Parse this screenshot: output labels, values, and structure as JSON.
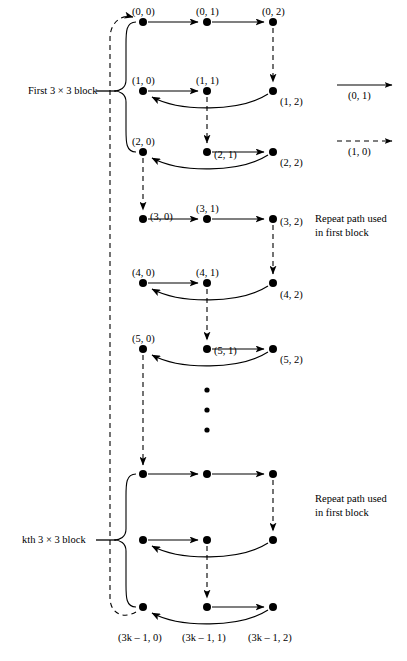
{
  "figure": {
    "kind": "lattice-path-diagram",
    "width": 407,
    "height": 661,
    "background": "#ffffff",
    "ink": "#000000"
  },
  "left_labels": {
    "first_block": "First 3 × 3 block",
    "kth_block_prefix": "k",
    "kth_block_rest": "th 3 × 3 block"
  },
  "legend": {
    "solid": {
      "style": "solid-arrow",
      "label": "(0, 1)"
    },
    "dashed": {
      "style": "dashed-arrow",
      "label": "(1, 0)"
    }
  },
  "annotations": [
    {
      "line1": "Repeat path used",
      "line2": "in first block"
    },
    {
      "line1": "Repeat path used",
      "line2": "in first block"
    }
  ],
  "nodes": [
    {
      "id": "n00",
      "label": "(0, 0)",
      "x": 143,
      "y": 22,
      "lx": 132,
      "ly": 5,
      "label_anchor": "start"
    },
    {
      "id": "n01",
      "label": "(0, 1)",
      "x": 207,
      "y": 22,
      "lx": 196,
      "ly": 5,
      "label_anchor": "start"
    },
    {
      "id": "n02",
      "label": "(0, 2)",
      "x": 273,
      "y": 22,
      "lx": 262,
      "ly": 5,
      "label_anchor": "start"
    },
    {
      "id": "n10",
      "label": "(1, 0)",
      "x": 143,
      "y": 91,
      "lx": 132,
      "ly": 74,
      "label_anchor": "start"
    },
    {
      "id": "n11",
      "label": "(1, 1)",
      "x": 207,
      "y": 91,
      "lx": 196,
      "ly": 74,
      "label_anchor": "start"
    },
    {
      "id": "n12",
      "label": "(1, 2)",
      "x": 273,
      "y": 91,
      "lx": 280,
      "ly": 95,
      "label_anchor": "start"
    },
    {
      "id": "n20",
      "label": "(2, 0)",
      "x": 143,
      "y": 152,
      "lx": 132,
      "ly": 135,
      "label_anchor": "start"
    },
    {
      "id": "n21",
      "label": "(2, 1)",
      "x": 207,
      "y": 152,
      "lx": 214,
      "ly": 148,
      "label_anchor": "start"
    },
    {
      "id": "n22",
      "label": "(2, 2)",
      "x": 273,
      "y": 152,
      "lx": 280,
      "ly": 156,
      "label_anchor": "start"
    },
    {
      "id": "n30",
      "label": "(3, 0)",
      "x": 143,
      "y": 219,
      "lx": 150,
      "ly": 210,
      "label_anchor": "start"
    },
    {
      "id": "n31",
      "label": "(3, 1)",
      "x": 207,
      "y": 219,
      "lx": 196,
      "ly": 202,
      "label_anchor": "start"
    },
    {
      "id": "n32",
      "label": "(3, 2)",
      "x": 273,
      "y": 219,
      "lx": 280,
      "ly": 215,
      "label_anchor": "start"
    },
    {
      "id": "n40",
      "label": "(4, 0)",
      "x": 143,
      "y": 283,
      "lx": 132,
      "ly": 266,
      "label_anchor": "start"
    },
    {
      "id": "n41",
      "label": "(4, 1)",
      "x": 207,
      "y": 283,
      "lx": 196,
      "ly": 266,
      "label_anchor": "start"
    },
    {
      "id": "n42",
      "label": "(4, 2)",
      "x": 273,
      "y": 283,
      "lx": 280,
      "ly": 288,
      "label_anchor": "start"
    },
    {
      "id": "n50",
      "label": "(5, 0)",
      "x": 143,
      "y": 349,
      "lx": 132,
      "ly": 332,
      "label_anchor": "start"
    },
    {
      "id": "n51",
      "label": "(5, 1)",
      "x": 207,
      "y": 349,
      "lx": 214,
      "ly": 344,
      "label_anchor": "start"
    },
    {
      "id": "n52",
      "label": "(5, 2)",
      "x": 273,
      "y": 349,
      "lx": 280,
      "ly": 353,
      "label_anchor": "start"
    },
    {
      "id": "nk00",
      "label": "",
      "x": 143,
      "y": 474,
      "lx": 0,
      "ly": 0,
      "label_anchor": "start"
    },
    {
      "id": "nk01",
      "label": "",
      "x": 207,
      "y": 474,
      "lx": 0,
      "ly": 0,
      "label_anchor": "start"
    },
    {
      "id": "nk02",
      "label": "",
      "x": 273,
      "y": 474,
      "lx": 0,
      "ly": 0,
      "label_anchor": "start"
    },
    {
      "id": "nk10",
      "label": "",
      "x": 143,
      "y": 540,
      "lx": 0,
      "ly": 0,
      "label_anchor": "start"
    },
    {
      "id": "nk11",
      "label": "",
      "x": 207,
      "y": 540,
      "lx": 0,
      "ly": 0,
      "label_anchor": "start"
    },
    {
      "id": "nk12",
      "label": "",
      "x": 273,
      "y": 540,
      "lx": 0,
      "ly": 0,
      "label_anchor": "start"
    },
    {
      "id": "nk20",
      "label": "(3k – 1, 0)",
      "x": 143,
      "y": 607,
      "lx": 118,
      "ly": 631,
      "label_anchor": "start"
    },
    {
      "id": "nk21",
      "label": "(3k – 1, 1)",
      "x": 207,
      "y": 607,
      "lx": 182,
      "ly": 631,
      "label_anchor": "start"
    },
    {
      "id": "nk22",
      "label": "(3k – 1, 2)",
      "x": 273,
      "y": 607,
      "lx": 248,
      "ly": 631,
      "label_anchor": "start"
    }
  ],
  "ellipsis_dots": [
    {
      "x": 207,
      "y": 390
    },
    {
      "x": 207,
      "y": 410
    },
    {
      "x": 207,
      "y": 430
    }
  ],
  "chart_data": {
    "type": "diagram",
    "grid_columns": 3,
    "grid_rows_label": "3k",
    "step_vectors": {
      "solid": "(0, 1)",
      "dashed": "(1, 0)"
    },
    "row_labels": [
      "0",
      "1",
      "2",
      "3",
      "4",
      "5",
      "...",
      "3k – 1"
    ],
    "column_labels": [
      "0",
      "1",
      "2"
    ],
    "path_sequence": [
      "(0, 0)",
      "(0, 1)",
      "(0, 2)",
      "(1, 2)",
      "(1, 0)",
      "(1, 1)",
      "(2, 1)",
      "(2, 2)",
      "(2, 0)",
      "(3, 0)",
      "(3, 1)",
      "(3, 2)",
      "(4, 2)",
      "(4, 0)",
      "(4, 1)",
      "(5, 1)",
      "(5, 2)",
      "(5, 0)",
      "(3k – 1, 0)",
      "(3k – 1, 1)",
      "(3k – 1, 2)"
    ],
    "notes": [
      "Solid arrows advance the second coordinate by 1: (0, 1)",
      "Dashed arrows advance the first coordinate by 1: (1, 0)",
      "The long dashed arc on the far left returns from (3k – 1, 0) to (0, 0), closing the cycle"
    ]
  }
}
